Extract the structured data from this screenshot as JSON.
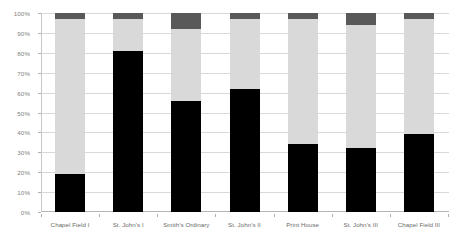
{
  "chart_data": {
    "type": "bar",
    "subtype": "100% stacked column",
    "title": "",
    "xlabel": "",
    "ylabel": "",
    "ylim": [
      0,
      100
    ],
    "yunit": "%",
    "grid": true,
    "legend": "none",
    "categories": [
      "Chapel Field I",
      "St. John's I",
      "Smith's Ordinary",
      "St. John's II",
      "Print House",
      "St. John's III",
      "Chapel Field III"
    ],
    "ytick_labels": [
      "0%",
      "10%",
      "20%",
      "30%",
      "40%",
      "50%",
      "60%",
      "70%",
      "80%",
      "90%",
      "100%"
    ],
    "ytick_values": [
      0,
      10,
      20,
      30,
      40,
      50,
      60,
      70,
      80,
      90,
      100
    ],
    "series": [
      {
        "name": "series-1",
        "color": "#000000",
        "values": [
          19,
          81,
          56,
          62,
          34,
          32,
          39
        ]
      },
      {
        "name": "series-2",
        "color": "#d9d9d9",
        "values": [
          78,
          16,
          36,
          35,
          63,
          62,
          58
        ]
      },
      {
        "name": "series-3",
        "color": "#595959",
        "values": [
          3,
          3,
          8,
          3,
          3,
          6,
          3
        ]
      }
    ]
  },
  "colors": {
    "background": "#ffffff",
    "gridline": "#d9d9d9",
    "axis_line": "#b4b4b4",
    "tick_text": "#808080",
    "category_text": "#6b6b6b"
  }
}
